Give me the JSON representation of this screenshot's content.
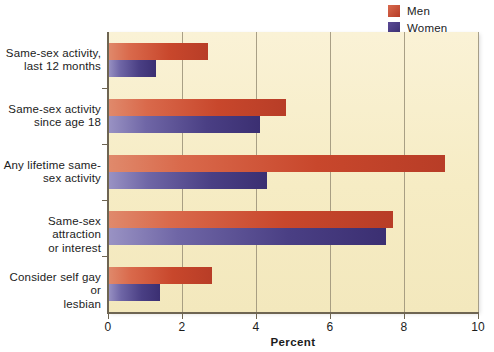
{
  "legend": {
    "position": "top-right",
    "entries": [
      {
        "label": "Men",
        "color": "#c8472c",
        "key": "men"
      },
      {
        "label": "Women",
        "color": "#4a3f84",
        "key": "women"
      }
    ]
  },
  "axis": {
    "x_title": "Percent",
    "x_ticks": [
      "0",
      "2",
      "4",
      "6",
      "8",
      "10"
    ],
    "x_min": 0,
    "x_max": 10
  },
  "chart_data": {
    "type": "bar",
    "orientation": "horizontal",
    "title": "",
    "xlabel": "Percent",
    "ylabel": "",
    "xlim": [
      0,
      10
    ],
    "grid": true,
    "legend_position": "top-right",
    "categories": [
      "Same-sex activity, last 12 months",
      "Same-sex activity since age 18",
      "Any lifetime same-sex activity",
      "Same-sex attraction or interest",
      "Consider self gay or lesbian"
    ],
    "category_lines": [
      [
        "Same-sex activity,",
        "last 12 months"
      ],
      [
        "Same-sex activity",
        "since age 18"
      ],
      [
        "Any lifetime same-",
        "sex activity"
      ],
      [
        "Same-sex attraction",
        "or interest"
      ],
      [
        "Consider self gay or",
        "lesbian"
      ]
    ],
    "series": [
      {
        "name": "Men",
        "color": "#c8472c",
        "values": [
          2.7,
          4.8,
          9.1,
          7.7,
          2.8
        ]
      },
      {
        "name": "Women",
        "color": "#4a3f84",
        "values": [
          1.3,
          4.1,
          4.3,
          7.5,
          1.4
        ]
      }
    ]
  }
}
